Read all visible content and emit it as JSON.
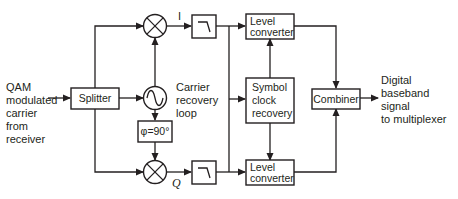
{
  "diagram": {
    "input_label": [
      "QAM",
      "modulated",
      "carrier",
      "from",
      "receiver"
    ],
    "blocks": {
      "splitter": "Splitter",
      "carrier_recovery": [
        "Carrier",
        "recovery",
        "loop"
      ],
      "phase_shift": "φ=90°",
      "level_converter_top": [
        "Level",
        "converter"
      ],
      "symbol_clock": [
        "Symbol",
        "clock",
        "recovery"
      ],
      "level_converter_bottom": [
        "Level",
        "converter"
      ],
      "combiner": "Combiner"
    },
    "branch_labels": {
      "i": "I",
      "q": "Q"
    },
    "output_label": [
      "Digital",
      "baseband",
      "signal",
      "to multiplexer"
    ],
    "colors": {
      "line": "#231f20",
      "background": "#ffffff"
    }
  }
}
